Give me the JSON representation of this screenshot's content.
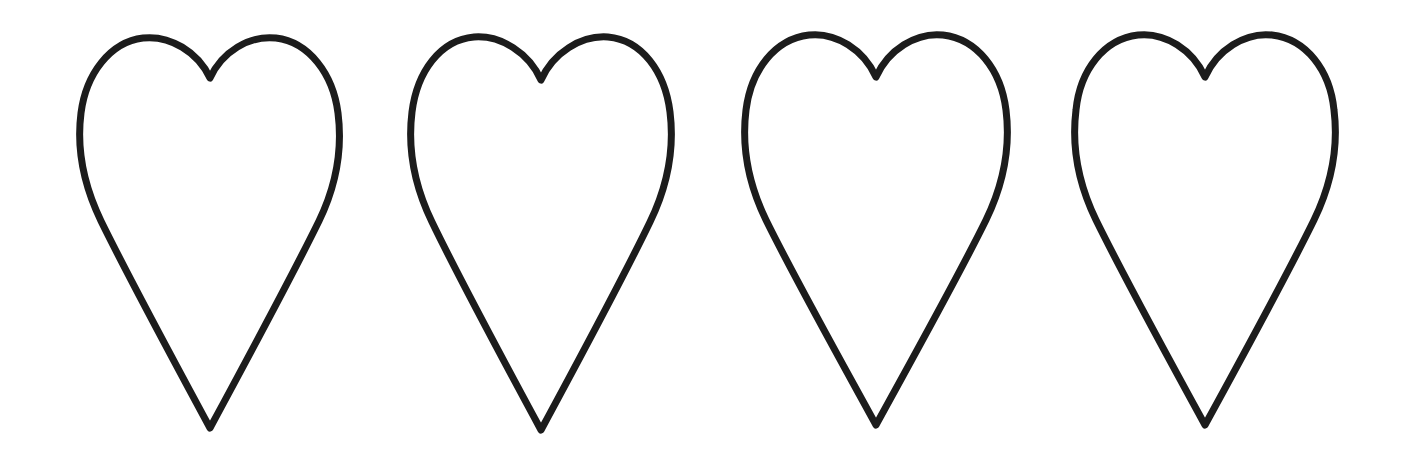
{
  "image": {
    "title": "Four Heart Outlines",
    "kind": "line-drawing",
    "width": 1403,
    "height": 465,
    "background_color": "#ffffff",
    "stroke_color": "#1c1c1c",
    "stroke_width": 7,
    "fill": "none",
    "shape_count": 4,
    "shape_name": "heart",
    "arrangement": "horizontal-row",
    "style": "hand-drawn outline, no shading, no text"
  },
  "shapes": [
    {
      "index": 1,
      "name": "heart-outline-1",
      "label": "Heart 1",
      "center_x": 210,
      "left_x": 80,
      "right_x": 336,
      "top_y": 37,
      "tip_y": 428,
      "notch_y": 78,
      "width": 256,
      "height": 391,
      "path": "M 210 78 C 198 52 170 35 143 38 C 110 42 86 74 81 113 C 76 152 86 190 101 221 C 128 276 170 354 210 428 C 250 354 292 276 319 221 C 334 190 343 152 338 113 C 333 74 309 42 276 38 C 249 35 222 52 210 78 Z"
    },
    {
      "index": 2,
      "name": "heart-outline-2",
      "label": "Heart 2",
      "center_x": 541,
      "left_x": 410,
      "right_x": 668,
      "top_y": 34,
      "tip_y": 430,
      "notch_y": 80,
      "width": 258,
      "height": 396,
      "path": "M 541 80 C 529 53 501 35 474 37 C 440 40 417 72 412 112 C 407 152 417 191 432 222 C 459 278 501 356 541 430 C 581 356 623 278 650 222 C 665 191 675 152 670 112 C 665 72 642 40 608 37 C 581 35 553 53 541 80 Z"
    },
    {
      "index": 3,
      "name": "heart-outline-3",
      "label": "Heart 3",
      "center_x": 876,
      "left_x": 745,
      "right_x": 1005,
      "top_y": 33,
      "tip_y": 425,
      "notch_y": 77,
      "width": 260,
      "height": 392,
      "path": "M 876 77 C 864 50 836 32 809 35 C 775 39 751 70 746 110 C 741 150 751 189 766 220 C 793 275 836 352 876 425 C 916 352 959 275 986 220 C 1001 189 1011 150 1006 110 C 1001 70 977 39 943 35 C 916 32 888 50 876 77 Z"
    },
    {
      "index": 4,
      "name": "heart-outline-4",
      "label": "Heart 4",
      "center_x": 1205,
      "left_x": 1075,
      "right_x": 1333,
      "top_y": 33,
      "tip_y": 425,
      "notch_y": 77,
      "width": 258,
      "height": 392,
      "path": "M 1205 77 C 1193 50 1165 32 1138 35 C 1104 39 1080 70 1076 110 C 1071 150 1081 189 1096 220 C 1123 275 1165 352 1205 425 C 1245 352 1287 275 1314 220 C 1329 189 1339 150 1334 110 C 1330 70 1306 39 1272 35 C 1245 32 1217 50 1205 77 Z"
    }
  ]
}
